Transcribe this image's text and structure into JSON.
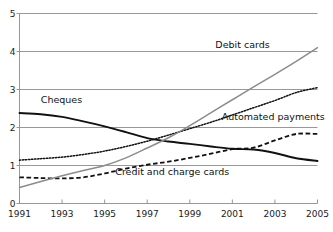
{
  "chart_data": {
    "type": "line",
    "title": "",
    "subtitle": "",
    "xlabel": "",
    "ylabel": "",
    "xlim": [
      1991,
      2005
    ],
    "ylim": [
      0,
      5
    ],
    "grid": true,
    "gridlines_y": [
      1,
      2,
      3,
      4,
      5
    ],
    "legend_position": "inline-annotations",
    "x": [
      1991,
      1992,
      1993,
      1994,
      1995,
      1996,
      1997,
      1998,
      1999,
      2000,
      2001,
      2002,
      2003,
      2004,
      2005
    ],
    "xticks": [
      1991,
      1993,
      1995,
      1997,
      1999,
      2001,
      2003,
      2005
    ],
    "xtick_labels": [
      "1991",
      "1993",
      "1995",
      "1997",
      "1999",
      "2001",
      "2003",
      "2005"
    ],
    "yticks": [
      0,
      1,
      2,
      3,
      4,
      5
    ],
    "ytick_labels": [
      "0",
      "1",
      "2",
      "3",
      "4",
      "5"
    ],
    "series": [
      {
        "name": "Cheques",
        "style": "solid",
        "color": "#111111",
        "width": 1.9,
        "label_x": 1992.0,
        "label_y": 2.72,
        "values": [
          2.38,
          2.35,
          2.28,
          2.16,
          2.03,
          1.88,
          1.72,
          1.63,
          1.57,
          1.5,
          1.44,
          1.42,
          1.33,
          1.19,
          1.12
        ]
      },
      {
        "name": "Automated payments",
        "style": "dotted",
        "color": "#111111",
        "width": 1.5,
        "label_x": 2000.5,
        "label_y": 2.28,
        "values": [
          1.14,
          1.18,
          1.22,
          1.29,
          1.38,
          1.5,
          1.64,
          1.8,
          1.97,
          2.14,
          2.33,
          2.52,
          2.71,
          2.92,
          3.05
        ]
      },
      {
        "name": "Credit and charge cards",
        "style": "dashed",
        "color": "#111111",
        "width": 1.8,
        "label_x": 1995.5,
        "label_y": 0.82,
        "values": [
          0.69,
          0.67,
          0.66,
          0.69,
          0.79,
          0.92,
          1.02,
          1.1,
          1.2,
          1.31,
          1.43,
          1.47,
          1.66,
          1.83,
          1.83
        ]
      },
      {
        "name": "Debit cards",
        "style": "solid",
        "color": "#8c8c8c",
        "width": 1.5,
        "label_x": 2000.2,
        "label_y": 4.18,
        "values": [
          0.42,
          0.58,
          0.73,
          0.87,
          1.0,
          1.2,
          1.46,
          1.73,
          2.05,
          2.39,
          2.73,
          3.07,
          3.4,
          3.74,
          4.1
        ]
      }
    ]
  },
  "axes": {
    "axis_color": "#8c8c8c",
    "grid_color": "#8c8c8c",
    "text_color": "#111111"
  }
}
